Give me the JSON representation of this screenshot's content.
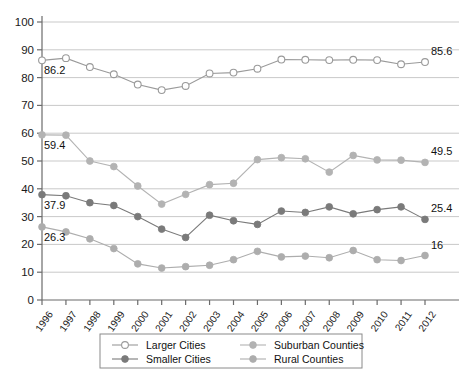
{
  "chart_data": {
    "type": "line",
    "title": "",
    "xlabel": "",
    "ylabel": "",
    "ylim": [
      0,
      100
    ],
    "ytick_step": 10,
    "grid": "horizontal",
    "legend_position": "bottom",
    "categories": [
      "1996",
      "1997",
      "1998",
      "1999",
      "2000",
      "2001",
      "2002",
      "2003",
      "2004",
      "2005",
      "2006",
      "2007",
      "2008",
      "2009",
      "2010",
      "2011",
      "2012"
    ],
    "series": [
      {
        "name": "Larger Cities",
        "marker": "open-circle",
        "color": "#9a9a9a",
        "start_label": "86.2",
        "end_label": "85.6",
        "values": [
          86.2,
          87.0,
          83.8,
          81.2,
          77.5,
          75.5,
          77.0,
          81.5,
          81.8,
          83.2,
          86.5,
          86.4,
          86.3,
          86.4,
          86.3,
          84.8,
          85.6
        ]
      },
      {
        "name": "Suburban Counties",
        "marker": "filled-circle-light",
        "color": "#b3b3b3",
        "start_label": "59.4",
        "end_label": "49.5",
        "values": [
          59.4,
          59.3,
          50.0,
          48.0,
          41.0,
          34.5,
          38.0,
          41.5,
          42.0,
          50.5,
          51.2,
          50.8,
          46.0,
          52.0,
          50.4,
          50.3,
          49.5
        ]
      },
      {
        "name": "Smaller Cities",
        "marker": "filled-circle-dark",
        "color": "#7a7a7a",
        "start_label": "37.9",
        "end_label": "25.4",
        "values": [
          37.9,
          37.5,
          35.0,
          34.0,
          30.0,
          25.5,
          22.5,
          30.5,
          28.5,
          27.2,
          32.0,
          31.5,
          33.5,
          31.0,
          32.5,
          33.5,
          29.0
        ]
      },
      {
        "name": "Rural Counties",
        "marker": "filled-circle-mid",
        "color": "#adadad",
        "start_label": "26.3",
        "end_label": "16",
        "values": [
          26.3,
          24.5,
          22.0,
          18.5,
          13.0,
          11.5,
          12.0,
          12.5,
          14.5,
          17.5,
          15.5,
          15.8,
          15.2,
          17.8,
          14.5,
          14.2,
          16.0
        ]
      }
    ],
    "endpoint_overrides": {
      "Larger Cities": {
        "last": 85.6
      },
      "Suburban Counties": {
        "last": 49.5
      },
      "Smaller Cities": {
        "last": 25.4
      },
      "Rural Counties": {
        "last": 16.0
      }
    }
  },
  "legend": {
    "entries": [
      {
        "label": "Larger Cities"
      },
      {
        "label": "Suburban Counties"
      },
      {
        "label": "Smaller Cities"
      },
      {
        "label": "Rural Counties"
      }
    ]
  },
  "colors": {
    "grid": "#c9c9c9",
    "axis": "#6b6b6b",
    "larger_cities": "#9a9a9a",
    "suburban_counties": "#b3b3b3",
    "smaller_cities": "#7a7a7a",
    "rural_counties": "#adadad"
  }
}
